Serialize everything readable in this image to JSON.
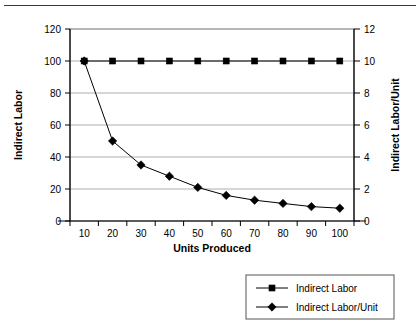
{
  "figure": {
    "name": "indirect-labor-chart",
    "has_top_rule": true,
    "background": "#ffffff"
  },
  "chart_data": {
    "type": "line",
    "title": "",
    "subtitle": "",
    "xlabel": "Units Produced",
    "ylabel": "Indirect Labor",
    "y2label": "Indirect Labor/Unit",
    "x": [
      10,
      20,
      30,
      40,
      50,
      60,
      70,
      80,
      90,
      100
    ],
    "xtick_labels": [
      "10",
      "20",
      "30",
      "40",
      "50",
      "60",
      "70",
      "80",
      "90",
      "100"
    ],
    "xlim": [
      5,
      105
    ],
    "ylim": [
      0,
      120
    ],
    "ytick_labels": [
      "0",
      "20",
      "40",
      "60",
      "80",
      "100",
      "120"
    ],
    "yticks": [
      0,
      20,
      40,
      60,
      80,
      100,
      120
    ],
    "y2lim": [
      0,
      12
    ],
    "y2tick_labels": [
      "0",
      "2",
      "4",
      "6",
      "8",
      "10",
      "12"
    ],
    "y2ticks": [
      0,
      2,
      4,
      6,
      8,
      10,
      12
    ],
    "grid": true,
    "grid_axis": "y",
    "legend_position": "bottom-right",
    "series": [
      {
        "name": "Indirect Labor",
        "axis": "left",
        "marker": "square",
        "color": "#000000",
        "values": [
          100,
          100,
          100,
          100,
          100,
          100,
          100,
          100,
          100,
          100
        ]
      },
      {
        "name": "Indirect Labor/Unit",
        "axis": "right",
        "marker": "diamond",
        "color": "#000000",
        "values": [
          10,
          5,
          3.5,
          2.8,
          2.1,
          1.6,
          1.3,
          1.1,
          0.9,
          0.8
        ]
      }
    ],
    "legend": [
      "Indirect Labor",
      "Indirect Labor/Unit"
    ]
  }
}
